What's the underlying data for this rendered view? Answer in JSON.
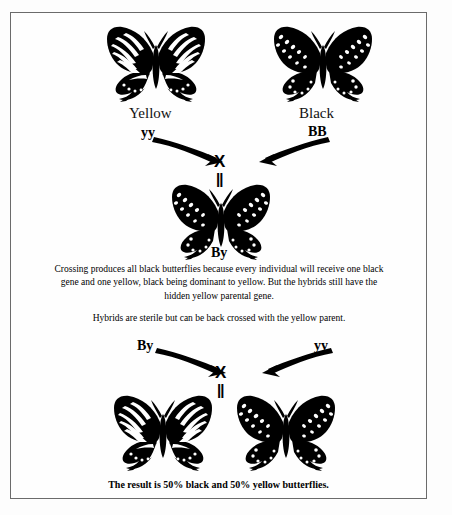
{
  "diagram": {
    "title_implicit": "Butterfly genetics cross diagram",
    "cross_one": {
      "parent_left": {
        "phenotype_label": "Yellow",
        "genotype_label": "yy",
        "icon": "yellow-swallowtail-butterfly-icon"
      },
      "parent_right": {
        "phenotype_label": "Black",
        "genotype_label": "BB",
        "icon": "black-swallowtail-butterfly-icon"
      },
      "cross_symbol": "X",
      "equals_symbol": "||",
      "offspring": {
        "genotype_label": "By",
        "icon": "black-hybrid-butterfly-icon"
      }
    },
    "explanation": {
      "paragraph_1": "Crossing produces all black butterflies because every individual will receive one black gene and one yellow, black being dominant to yellow. But the hybrids still have the hidden yellow parental gene.",
      "paragraph_2": "Hybrids are sterile but can be back crossed with the yellow parent."
    },
    "cross_two": {
      "parent_left": {
        "genotype_label": "By"
      },
      "parent_right": {
        "genotype_label": "yy"
      },
      "cross_symbol": "X",
      "equals_symbol": "||",
      "offspring_left": {
        "icon": "yellow-swallowtail-butterfly-icon"
      },
      "offspring_right": {
        "icon": "black-swallowtail-butterfly-icon"
      }
    },
    "result_caption": "The result is 50% black and 50% yellow butterflies.",
    "colors": {
      "ink": "#000000",
      "border": "#6b6b6b",
      "page_background": "#fdfdfd"
    }
  }
}
